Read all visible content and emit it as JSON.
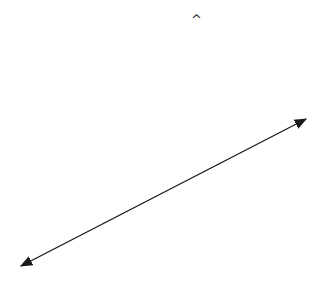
{
  "diagram": {
    "caret_symbol": "^",
    "line": {
      "start": [
        19,
        267
      ],
      "end": [
        308,
        118
      ],
      "color": "#1a1a1a",
      "arrowheads": "both"
    }
  }
}
